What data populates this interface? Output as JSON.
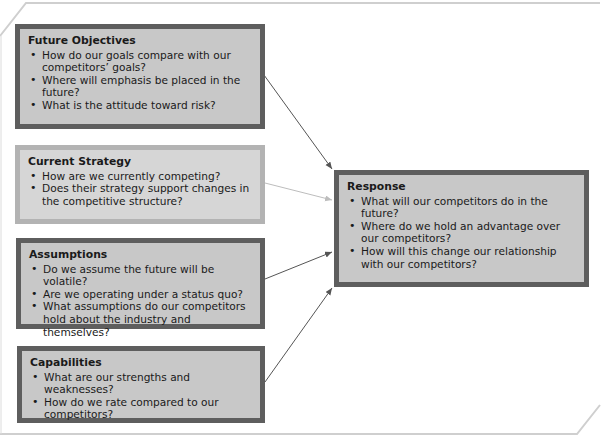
{
  "diagram": {
    "type": "competitor-analysis-framework",
    "inputs": [
      {
        "id": "future-objectives",
        "title": "Future Objectives",
        "style": "dark",
        "items": [
          "How do our goals compare with our competitors’ goals?",
          "Where will emphasis be placed in the future?",
          "What is the attitude toward risk?"
        ]
      },
      {
        "id": "current-strategy",
        "title": "Current Strategy",
        "style": "light",
        "items": [
          "How are we currently competing?",
          "Does their strategy support changes in the competitive structure?"
        ]
      },
      {
        "id": "assumptions",
        "title": "Assumptions",
        "style": "dark",
        "items": [
          "Do we assume the future will be volatile?",
          "Are we operating under a status quo?",
          "What assumptions do our competitors hold about the industry and themselves?"
        ]
      },
      {
        "id": "capabilities",
        "title": "Capabilities",
        "style": "dark",
        "items": [
          "What are our strengths and weaknesses?",
          "How do we rate compared to our competitors?"
        ]
      }
    ],
    "output": {
      "id": "response",
      "title": "Response",
      "style": "dark",
      "items": [
        "What will our competitors do in the future?",
        "Where do we hold an advantage over our competitors?",
        "How will this change our relationship with our competitors?"
      ]
    },
    "edges": [
      {
        "from": "future-objectives",
        "to": "response"
      },
      {
        "from": "current-strategy",
        "to": "response"
      },
      {
        "from": "assumptions",
        "to": "response"
      },
      {
        "from": "capabilities",
        "to": "response"
      }
    ],
    "colors": {
      "dark_border": "#5e5e5e",
      "light_border": "#b3b3b3",
      "dark_fill": "#c8c8c8",
      "light_fill": "#d6d6d6",
      "arrow_dark": "#555555",
      "arrow_light": "#bdbdbd"
    }
  }
}
